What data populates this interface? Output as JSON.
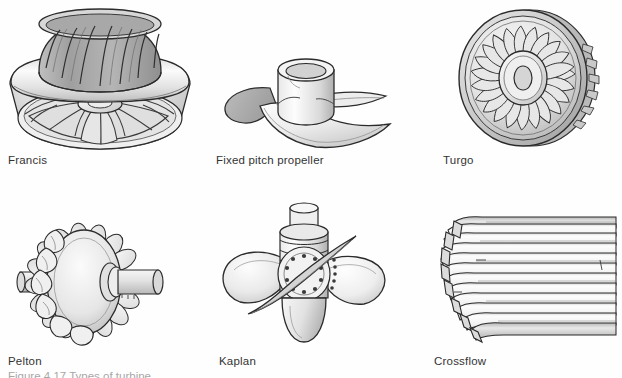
{
  "figure": {
    "background_color": "#fefefe",
    "ink_color": "#2b2b2b",
    "grey_light": "#f2f2f2",
    "grey_mid": "#cfcfcf",
    "grey_dark": "#9a9a9a",
    "grey_shadow": "#8d8d8d",
    "columns": 3,
    "rows": 2,
    "caption_partial": "Figure 4.17 Types of turbine"
  },
  "items": [
    {
      "id": "francis",
      "label": "Francis",
      "icon": "francis-turbine-runner-illustration",
      "label_x": 8,
      "label_y": 155,
      "art_x": 5,
      "art_y": 6,
      "art_w": 185,
      "art_h": 140
    },
    {
      "id": "fixed-pitch-propeller",
      "label": "Fixed pitch propeller",
      "icon": "fixed-pitch-propeller-illustration",
      "label_x": 216,
      "label_y": 155,
      "art_x": 200,
      "art_y": 48,
      "art_w": 190,
      "art_h": 100
    },
    {
      "id": "turgo",
      "label": "Turgo",
      "icon": "turgo-turbine-runner-illustration",
      "label_x": 443,
      "label_y": 155,
      "art_x": 445,
      "art_y": 8,
      "art_w": 165,
      "art_h": 140
    },
    {
      "id": "pelton",
      "label": "Pelton",
      "icon": "pelton-wheel-illustration",
      "label_x": 8,
      "label_y": 356,
      "art_x": 20,
      "art_y": 218,
      "art_w": 150,
      "art_h": 130
    },
    {
      "id": "kaplan",
      "label": "Kaplan",
      "icon": "kaplan-turbine-illustration",
      "label_x": 219,
      "label_y": 356,
      "art_x": 215,
      "art_y": 204,
      "art_w": 175,
      "art_h": 145
    },
    {
      "id": "crossflow",
      "label": "Crossflow",
      "icon": "crossflow-turbine-illustration",
      "label_x": 434,
      "label_y": 356,
      "art_x": 432,
      "art_y": 210,
      "art_w": 185,
      "art_h": 138
    }
  ]
}
